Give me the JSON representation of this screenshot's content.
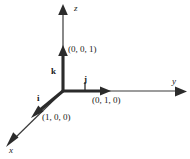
{
  "figure": {
    "background_color": "#ffffff",
    "stroke_color": "#3a3a3a",
    "thick_stroke_color": "#2b2b2b",
    "text_color": "#1a1a1a",
    "origin": {
      "x": 63,
      "y": 91
    }
  },
  "axes": [
    {
      "name": "z-axis",
      "label": "z",
      "label_x": 74,
      "label_y": 4,
      "from": {
        "x": 63,
        "y": 91
      },
      "to": {
        "x": 63,
        "y": 10
      },
      "direction": "up"
    },
    {
      "name": "y-axis",
      "label": "y",
      "label_x": 172,
      "label_y": 77,
      "from": {
        "x": 63,
        "y": 91
      },
      "to": {
        "x": 182,
        "y": 91
      },
      "direction": "right"
    },
    {
      "name": "x-axis",
      "label": "x",
      "label_x": 9,
      "label_y": 146,
      "from": {
        "x": 63,
        "y": 91
      },
      "to": {
        "x": 9,
        "y": 143
      },
      "direction": "down-left"
    }
  ],
  "vectors": [
    {
      "name": "k",
      "label": "k",
      "label_x": 51,
      "label_y": 67,
      "point_label": "(0, 0, 1)",
      "point_label_x": 68,
      "point_label_y": 45,
      "from": {
        "x": 63,
        "y": 91
      },
      "to": {
        "x": 63,
        "y": 50
      },
      "components": [
        0,
        0,
        1
      ]
    },
    {
      "name": "j",
      "label": "j",
      "label_x": 84,
      "label_y": 76,
      "point_label": "(0, 1, 0)",
      "point_label_x": 92,
      "point_label_y": 96,
      "from": {
        "x": 63,
        "y": 91
      },
      "to": {
        "x": 108,
        "y": 91
      },
      "components": [
        0,
        1,
        0
      ]
    },
    {
      "name": "i",
      "label": "i",
      "label_x": 37,
      "label_y": 94,
      "point_label": "(1, 0, 0)",
      "point_label_x": 42,
      "point_label_y": 113,
      "from": {
        "x": 63,
        "y": 91
      },
      "to": {
        "x": 34,
        "y": 115
      },
      "components": [
        1,
        0,
        0
      ]
    }
  ],
  "tick_marks": [
    {
      "name": "j-tick",
      "x": 85,
      "y_top": 82,
      "y_bottom": 91
    }
  ]
}
